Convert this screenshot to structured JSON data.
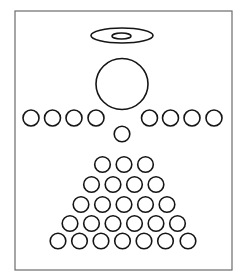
{
  "figure": {
    "colors": {
      "background": "#ffffff",
      "frame": "#6b6b6b",
      "stroke": "#151515"
    },
    "frame": {
      "x": 15,
      "y": 11,
      "width": 217,
      "height": 259
    },
    "halo": {
      "outer": {
        "cx": 122,
        "cy": 35.5,
        "rx": 31,
        "ry": 7.5
      },
      "inner": {
        "cx": 121.5,
        "cy": 36,
        "rx": 9.5,
        "ry": 3
      }
    },
    "head": {
      "cx": 122,
      "cy": 84,
      "rx": 26,
      "ry": 25.5
    },
    "wing_radius": 8,
    "left_wing": {
      "cy": 118,
      "cx": [
        31,
        52.5,
        74,
        96
      ]
    },
    "right_wing": {
      "cy": 118,
      "cx": [
        149.5,
        170.5,
        192,
        214
      ]
    },
    "neck": {
      "cx": 122,
      "cy": 134,
      "r": 7.8
    },
    "body_radius": 7.8,
    "body_rows": [
      {
        "count": 3,
        "cy": 164.5,
        "cx": [
          102.5,
          124,
          145.5
        ]
      },
      {
        "count": 4,
        "cy": 184.5,
        "cx": [
          91.5,
          113,
          134.5,
          156
        ]
      },
      {
        "count": 5,
        "cy": 204.5,
        "cx": [
          81,
          102.5,
          124,
          145.5,
          167
        ]
      },
      {
        "count": 6,
        "cy": 223.5,
        "cx": [
          70,
          91.5,
          113,
          134.5,
          156,
          177.5
        ]
      },
      {
        "count": 7,
        "cy": 241,
        "cx": [
          58,
          79.5,
          101,
          122.5,
          144,
          165.5,
          188
        ]
      }
    ]
  }
}
